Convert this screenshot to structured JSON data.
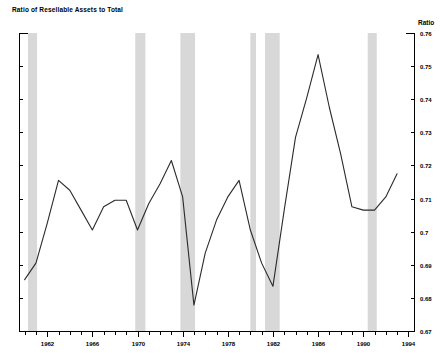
{
  "chart_data": {
    "type": "line",
    "title": "Ratio of Resellable Assets to Total",
    "xlabel": "",
    "ylabel": "Ratio",
    "ylim": [
      0.67,
      0.76
    ],
    "xlim": [
      1959.5,
      1994.5
    ],
    "grid": false,
    "legend": null,
    "y_ticks": [
      0.67,
      0.68,
      0.69,
      0.7,
      0.71,
      0.72,
      0.73,
      0.74,
      0.75,
      0.76
    ],
    "y_tick_labels": [
      "0.67",
      "0.68",
      "0.69",
      "0.7",
      "0.71",
      "0.72",
      "0.73",
      "0.74",
      "0.75",
      "0.76"
    ],
    "x_ticks": [
      1960,
      1961,
      1962,
      1963,
      1964,
      1965,
      1966,
      1967,
      1968,
      1969,
      1970,
      1971,
      1972,
      1973,
      1974,
      1975,
      1976,
      1977,
      1978,
      1979,
      1980,
      1981,
      1982,
      1983,
      1984,
      1985,
      1986,
      1987,
      1988,
      1989,
      1990,
      1991,
      1992,
      1993,
      1994
    ],
    "x_tick_labels": [
      "1962",
      "1966",
      "1970",
      "1974",
      "1978",
      "1982",
      "1986",
      "1990",
      "1994"
    ],
    "x_labeled_ticks": [
      1962,
      1966,
      1970,
      1974,
      1978,
      1982,
      1986,
      1990,
      1994
    ],
    "series": [
      {
        "name": "Ratio of Resellable Assets to Total",
        "color": "#2b2b2b",
        "x": [
          1960,
          1961,
          1962,
          1963,
          1964,
          1965,
          1966,
          1967,
          1968,
          1969,
          1970,
          1971,
          1972,
          1973,
          1974,
          1975,
          1976,
          1977,
          1978,
          1979,
          1980,
          1981,
          1982,
          1983,
          1984,
          1985,
          1986,
          1987,
          1988,
          1989,
          1990,
          1991,
          1992,
          1993
        ],
        "values": [
          0.6855,
          0.6905,
          0.7025,
          0.7155,
          0.7125,
          0.7065,
          0.7005,
          0.7075,
          0.7095,
          0.7095,
          0.7005,
          0.7085,
          0.7145,
          0.7215,
          0.7105,
          0.6778,
          0.6935,
          0.7035,
          0.7105,
          0.7155,
          0.7005,
          0.6905,
          0.6835,
          0.7065,
          0.7285,
          0.7405,
          0.7535,
          0.7375,
          0.7235,
          0.7075,
          0.7065,
          0.7065,
          0.7105,
          0.7175
        ]
      }
    ],
    "shaded_bands": [
      {
        "label": "recession-1960-1961",
        "start": 1960.3,
        "end": 1961.1
      },
      {
        "label": "recession-1969-1970",
        "start": 1969.8,
        "end": 1970.7
      },
      {
        "label": "recession-1973-1975",
        "start": 1973.8,
        "end": 1975.1
      },
      {
        "label": "recession-1980",
        "start": 1980.0,
        "end": 1980.5
      },
      {
        "label": "recession-1981-1982",
        "start": 1981.3,
        "end": 1982.6
      },
      {
        "label": "recession-1990-1991",
        "start": 1990.4,
        "end": 1991.2
      }
    ],
    "band_color": "#b8b8b8",
    "axis_color": "#000000",
    "background": "#ffffff"
  }
}
